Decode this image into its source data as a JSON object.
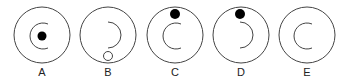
{
  "options": [
    {
      "label": "A",
      "cx": 42,
      "cy": 35,
      "arc": "left",
      "dot": {
        "type": "filled",
        "x": 45,
        "y": 36
      }
    },
    {
      "label": "B",
      "cx": 108,
      "cy": 35,
      "arc": "right",
      "dot": {
        "type": "hollow",
        "x": 107,
        "y": 57
      }
    },
    {
      "label": "C",
      "cx": 175,
      "cy": 35,
      "arc": "left",
      "dot": {
        "type": "filled",
        "x": 175,
        "y": 14
      }
    },
    {
      "label": "D",
      "cx": 241,
      "cy": 35,
      "arc": "right",
      "dot": {
        "type": "filled",
        "x": 240,
        "y": 14
      }
    },
    {
      "label": "E",
      "cx": 307,
      "cy": 35,
      "arc": "left",
      "dot": null
    }
  ],
  "colors": {
    "stroke": "#444444",
    "fill": "#000000"
  }
}
